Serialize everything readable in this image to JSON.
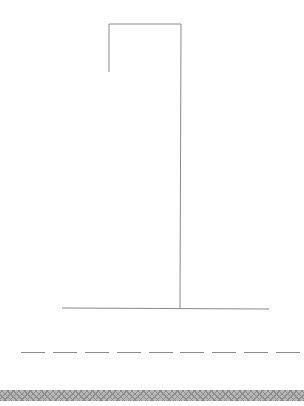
{
  "game": {
    "title": "Hangman",
    "wrong_guesses": 0,
    "word_length": 9,
    "revealed_letters": [
      "",
      "",
      "",
      "",
      "",
      "",
      "",
      "",
      ""
    ]
  },
  "gallows": {
    "stroke_color": "#8a8a8a",
    "base_color": "#8a8a8a"
  },
  "word_slots": {
    "dash_color": "#8a8a8a",
    "positions_x": [
      21,
      53,
      85,
      117,
      149,
      180,
      212,
      244,
      276
    ]
  },
  "bottom_strip": {
    "pattern": "crosshatch",
    "color": "#b8b8b8"
  }
}
